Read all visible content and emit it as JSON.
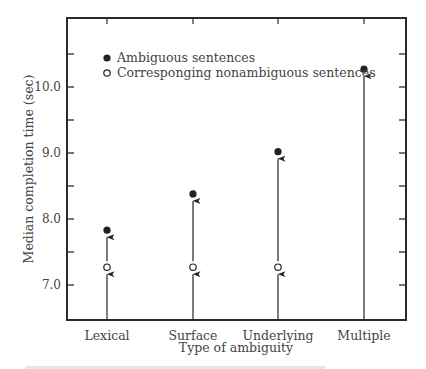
{
  "chart_data": {
    "type": "scatter",
    "title": "",
    "xlabel": "Type of ambiguity",
    "ylabel": "Median completion time (sec)",
    "categories": [
      "Lexical",
      "Surface",
      "Underlying",
      "Multiple"
    ],
    "series": [
      {
        "name": "Ambiguous sentences",
        "marker": "filled-circle",
        "values": [
          7.83,
          8.38,
          9.02,
          10.27
        ]
      },
      {
        "name": "Corresponging nonambiguous sentences",
        "marker": "open-circle",
        "values": [
          7.27,
          7.27,
          7.27,
          null
        ]
      }
    ],
    "yticks": [
      7.0,
      8.0,
      9.0,
      10.0
    ],
    "ytick_labels": [
      "7.0",
      "8.0",
      "9.0",
      "10.0"
    ],
    "minor_yticks": [
      7.5,
      8.5,
      9.5,
      10.5
    ],
    "ylim": [
      6.5,
      11.0
    ],
    "grid": false,
    "legend_position": "upper-left-inside",
    "annotations": "upward arrows from baseline to each marker"
  },
  "legend": {
    "filled": "Ambiguous sentences",
    "open": "Corresponging nonambiguous sentences"
  },
  "axes": {
    "xlabel": "Type of ambiguity",
    "ylabel": "Median completion time (sec)"
  }
}
